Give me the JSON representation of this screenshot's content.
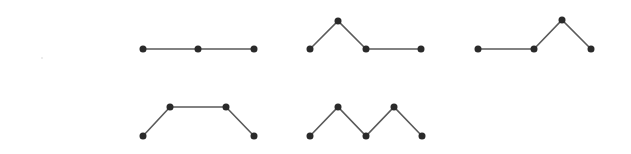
{
  "diagram": {
    "type": "path-graphs",
    "node_radius": 3.5,
    "colors": {
      "edge": "#5a5a5a",
      "node": "#2a2a2a",
      "background": "#ffffff"
    },
    "figures": [
      {
        "id": "path-1",
        "points": [
          [
            143,
            49
          ],
          [
            198,
            49
          ],
          [
            254,
            49
          ]
        ]
      },
      {
        "id": "path-2",
        "points": [
          [
            310,
            49
          ],
          [
            338,
            21
          ],
          [
            366,
            49
          ],
          [
            421,
            49
          ]
        ]
      },
      {
        "id": "path-3",
        "points": [
          [
            478,
            49
          ],
          [
            534,
            49
          ],
          [
            562,
            20
          ],
          [
            591,
            49
          ]
        ]
      },
      {
        "id": "path-4",
        "points": [
          [
            143,
            136
          ],
          [
            170,
            107
          ],
          [
            226,
            107
          ],
          [
            254,
            136
          ]
        ]
      },
      {
        "id": "path-5",
        "points": [
          [
            310,
            136
          ],
          [
            338,
            107
          ],
          [
            366,
            136
          ],
          [
            394,
            107
          ],
          [
            422,
            136
          ]
        ]
      }
    ]
  }
}
